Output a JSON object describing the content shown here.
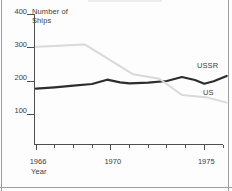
{
  "panel": {
    "background": "#fdfdfd",
    "border_color": "#9e9e9e",
    "text_color": "#3c3c3c"
  },
  "chart_data": {
    "type": "line",
    "title": "",
    "ylabel": "Number of Ships",
    "xlabel": "Year",
    "x_axis": {
      "min": 1966,
      "max": 1976,
      "tick_step": 1,
      "labeled_ticks": [
        1966,
        1970,
        1975
      ]
    },
    "y_axis": {
      "min": 0,
      "max": 400,
      "ticks": [
        100,
        200,
        300,
        400
      ]
    },
    "grid": false,
    "legend": "inline-end-of-line labels",
    "series": [
      {
        "name": "USSR",
        "color": "#2d2d2d",
        "stroke_width": 2.2,
        "points": [
          [
            1966,
            177
          ],
          [
            1967,
            181
          ],
          [
            1968,
            186
          ],
          [
            1969,
            191
          ],
          [
            1969.8,
            204
          ],
          [
            1970.5,
            196
          ],
          [
            1971,
            193
          ],
          [
            1972,
            195
          ],
          [
            1973,
            200
          ],
          [
            1973.8,
            212
          ],
          [
            1974.5,
            203
          ],
          [
            1975,
            192
          ],
          [
            1975.5,
            199
          ],
          [
            1976.2,
            215
          ]
        ]
      },
      {
        "name": "US",
        "color": "#d9d9d9",
        "stroke_width": 2,
        "points": [
          [
            1966,
            303
          ],
          [
            1967,
            305
          ],
          [
            1968,
            308
          ],
          [
            1968.6,
            310
          ],
          [
            1971.2,
            220
          ],
          [
            1972.6,
            207
          ],
          [
            1973.8,
            158
          ],
          [
            1975.2,
            150
          ],
          [
            1976.2,
            135
          ]
        ]
      }
    ],
    "layout": {
      "x0_px": 36,
      "px_per_year": 18.7,
      "y0_px": 147.5,
      "px_per_unit": 0.3325,
      "axis_y_px": 144.5,
      "axis_x_px": 34.5,
      "axis_top_px": 15,
      "axis_color": "#4f4f4f"
    }
  }
}
